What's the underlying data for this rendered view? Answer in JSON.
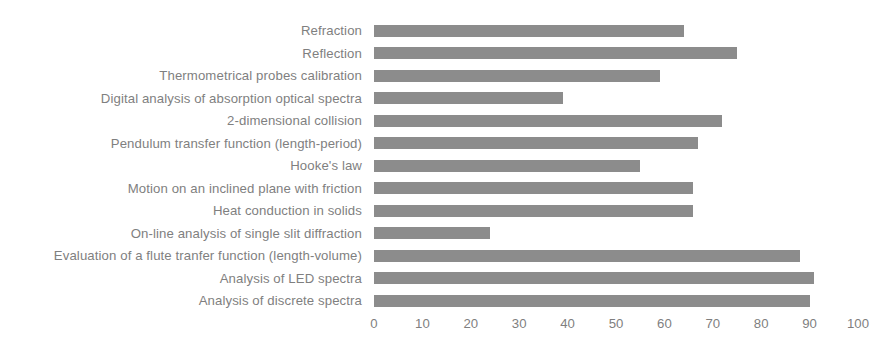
{
  "chart_data": {
    "type": "bar",
    "orientation": "horizontal",
    "title": "",
    "subtitle": "",
    "xlabel": "",
    "ylabel": "",
    "xlim": [
      0,
      100
    ],
    "xticks": [
      "0",
      "10",
      "20",
      "30",
      "40",
      "50",
      "60",
      "70",
      "80",
      "90",
      "100"
    ],
    "xtick_values": [
      0,
      10,
      20,
      30,
      40,
      50,
      60,
      70,
      80,
      90,
      100
    ],
    "grid": false,
    "legend": null,
    "bar_color": "#8c8c8c",
    "label_color": "#7f7f7f",
    "background_color": "#ffffff",
    "categories": [
      "Refraction",
      "Reflection",
      "Thermometrical probes calibration",
      "Digital analysis of absorption optical spectra",
      "2-dimensional collision",
      "Pendulum transfer function (length-period)",
      "Hooke's law",
      "Motion on an inclined plane with friction",
      "Heat conduction in solids",
      "On-line analysis of single slit diffraction",
      "Evaluation of a flute tranfer function (length-volume)",
      "Analysis of LED spectra",
      "Analysis of discrete spectra"
    ],
    "values": [
      64,
      75,
      59,
      39,
      72,
      67,
      55,
      66,
      66,
      24,
      88,
      91,
      90
    ]
  }
}
